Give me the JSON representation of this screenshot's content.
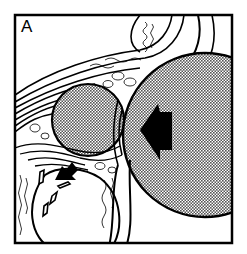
{
  "figure": {
    "panel_label": "A",
    "type": "anatomical line illustration",
    "colors": {
      "ink": "#000000",
      "paper": "#ffffff",
      "stipple_fill": "#9a9a9a"
    },
    "elements": {
      "large_sphere": "stippled large circle, right side",
      "small_sphere": "stippled smaller circle, upper left-center",
      "large_arrow": "black arrow pointing left inside large sphere",
      "small_arrow": "black arrow pointing down-left, lower left",
      "soft_tissue_bands": "curved layered bands across top",
      "bone_cancellous": "trabecular bone textures",
      "lower_oval": "white oval structure, lower left",
      "dashes": "small black dash marks, lower left"
    }
  }
}
